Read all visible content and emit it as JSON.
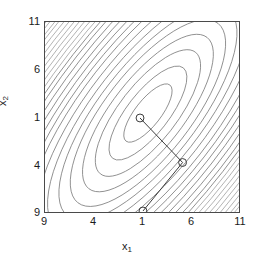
{
  "figure": {
    "background": "#ffffff",
    "frame_color": "#4a4a4a"
  },
  "axes": {
    "x_title": "x",
    "x_title_sub": "1",
    "y_title": "x",
    "y_title_sub": "2",
    "x_ticks": [
      "9",
      "4",
      "1",
      "6",
      "11"
    ],
    "y_ticks": [
      "11",
      "6",
      "1",
      "4",
      "9"
    ]
  },
  "chart_data": {
    "type": "line",
    "title": "",
    "xlabel": "x1",
    "ylabel": "x2",
    "xlim": [
      -9,
      11
    ],
    "ylim": [
      -9,
      11
    ],
    "x_tick_values": [
      -9,
      -4,
      1,
      6,
      11
    ],
    "y_tick_values": [
      -9,
      -4,
      1,
      6,
      11
    ],
    "x_tick_labels": [
      "9",
      "4",
      "1",
      "6",
      "11"
    ],
    "y_tick_labels": [
      "9",
      "4",
      "1",
      "6",
      "11"
    ],
    "grid": false,
    "legend": "none",
    "contours": {
      "style": "elliptical level sets, densely packed toward the upper-right and lower-left corners",
      "center": [
        1.6,
        3.0
      ],
      "major_axis_angle_deg": -52,
      "levels_count": 22,
      "line_color": "#6e6e6e"
    },
    "series": [
      {
        "name": "optimization path",
        "marker": "open-circle",
        "x": [
          1.0,
          -9.0,
          6.0
        ],
        "y": [
          1.0,
          1.0,
          -4.0
        ],
        "points_pixel": [
          {
            "cx": 140,
            "cy": 118
          },
          {
            "cx": 183,
            "cy": 163
          },
          {
            "cx": 143,
            "cy": 212
          }
        ],
        "color": "#3a3a3a"
      }
    ]
  }
}
